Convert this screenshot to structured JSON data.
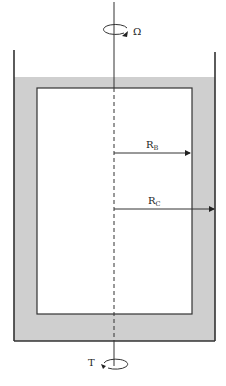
{
  "diagram": {
    "labels": {
      "angular_velocity": "Ω",
      "torque": "T",
      "r_bob_main": "R",
      "r_bob_sub": "B",
      "r_cup_main": "R",
      "r_cup_sub": "C"
    },
    "colors": {
      "fluid": "#cfcfcf",
      "line": "#333333",
      "background": "#ffffff"
    }
  }
}
